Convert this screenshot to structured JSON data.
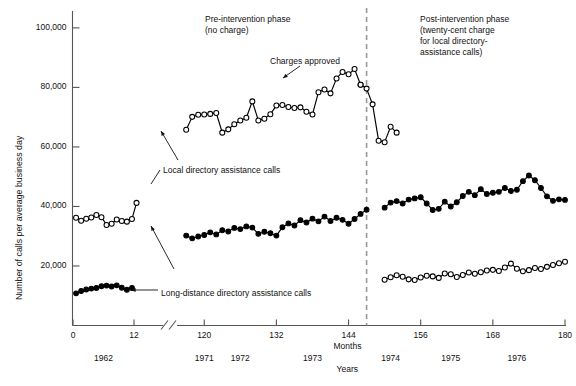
{
  "chart_data": {
    "type": "line",
    "title": "",
    "xlabel": "Months",
    "xlabel2": "Years",
    "ylabel": "Number of calls per average business day",
    "ylim": [
      0,
      105000
    ],
    "xlim": [
      0,
      180
    ],
    "grid": false,
    "legend_position": "inline-annotations",
    "y_ticks": [
      "20,000",
      "40,000",
      "60,000",
      "80,000",
      "100,000"
    ],
    "y_tick_values": [
      20000,
      40000,
      60000,
      80000,
      100000
    ],
    "x_ticks": [
      "0",
      "12",
      "120",
      "132",
      "144",
      "156",
      "168",
      "180"
    ],
    "x_tick_values": [
      0,
      12,
      120,
      132,
      144,
      156,
      168,
      180
    ],
    "axis_break_after": 12,
    "year_ticks": [
      {
        "label": "1962",
        "x": 6
      },
      {
        "label": "1971",
        "x": 120
      },
      {
        "label": "1972",
        "x": 126
      },
      {
        "label": "1973",
        "x": 138
      },
      {
        "label": "1974",
        "x": 151
      },
      {
        "label": "1975",
        "x": 161
      },
      {
        "label": "1976",
        "x": 172
      }
    ],
    "intervention_line_x": 147,
    "annotations": [
      {
        "name": "pre-intervention-label",
        "text": "Pre-intervention phase\n(no charge)",
        "x": 205,
        "y": 14
      },
      {
        "name": "post-intervention-label",
        "text": "Post-intervention phase\n(twenty-cent charge\nfor local directory-\nassistance calls)",
        "x": 420,
        "y": 14
      },
      {
        "name": "charges-approved-label",
        "text": "Charges approved",
        "x": 270,
        "y": 56
      },
      {
        "name": "local-series-label",
        "text": "Local directory assistance calls",
        "x": 163,
        "y": 165
      },
      {
        "name": "long-distance-series-label",
        "text": "Long-distance directory assistance calls",
        "x": 161,
        "y": 288
      }
    ],
    "series": [
      {
        "name": "Local directory assistance calls",
        "marker": "open-circle",
        "color": "#000000",
        "segments": [
          {
            "period": "1962",
            "x": [
              0.6,
              1.6,
              2.6,
              3.6,
              4.6,
              5.6,
              6.6,
              7.6,
              8.6,
              9.6,
              10.6,
              11.6,
              12.5
            ],
            "values": [
              36200,
              35200,
              35900,
              36300,
              37100,
              36400,
              33800,
              34200,
              35600,
              35100,
              34900,
              35800,
              41200
            ]
          },
          {
            "period": "1971-1973",
            "x": [
              117,
              118,
              119,
              120,
              121,
              122,
              123,
              124,
              125,
              126,
              127,
              128,
              129,
              130,
              131,
              132,
              133,
              134,
              135,
              136,
              137,
              138,
              139,
              140,
              141,
              142,
              143,
              144,
              145,
              146
            ],
            "values": [
              65800,
              70100,
              70800,
              70900,
              71100,
              71400,
              64800,
              65900,
              67600,
              68900,
              69800,
              75300,
              68900,
              69500,
              71000,
              73900,
              74100,
              73400,
              73100,
              73300,
              71800,
              70900,
              78400,
              79300,
              78000,
              83000,
              85200,
              84400,
              86200,
              80900
            ]
          },
          {
            "period": "1973-late",
            "x": [
              146,
              147,
              148,
              149,
              150,
              151,
              152
            ],
            "values": [
              80900,
              79600,
              74300,
              62100,
              61600,
              66800,
              64800
            ]
          }
        ]
      },
      {
        "name": "Local directory assistance calls (post)",
        "marker": "open-circle",
        "color": "#000000",
        "segments": [
          {
            "period": "1974-1976",
            "x": [
              150,
              151,
              152,
              153,
              154,
              155,
              156,
              157,
              158,
              159,
              160,
              161,
              162,
              163,
              164,
              165,
              166,
              167,
              168,
              169,
              170,
              171,
              172,
              173,
              174,
              175,
              176,
              177,
              178,
              179,
              180
            ],
            "values": [
              15400,
              16200,
              16900,
              16400,
              15500,
              15300,
              16100,
              16700,
              16500,
              16000,
              17500,
              17200,
              16300,
              17000,
              17800,
              17400,
              17900,
              18500,
              18700,
              18300,
              19500,
              20800,
              19100,
              18200,
              18600,
              19300,
              19000,
              19700,
              20300,
              20900,
              21400
            ]
          }
        ]
      },
      {
        "name": "Long-distance directory assistance calls",
        "marker": "filled-circle",
        "color": "#000000",
        "segments": [
          {
            "period": "1962",
            "x": [
              0.6,
              1.6,
              2.6,
              3.6,
              4.6,
              5.6,
              6.6,
              7.6,
              8.6,
              9.6,
              10.6,
              11.6
            ],
            "values": [
              10800,
              11600,
              12100,
              12400,
              12600,
              13200,
              13400,
              13100,
              13500,
              12700,
              12000,
              12600
            ]
          },
          {
            "period": "1971-1973",
            "x": [
              117,
              118,
              119,
              120,
              121,
              122,
              123,
              124,
              125,
              126,
              127,
              128,
              129,
              130,
              131,
              132,
              133,
              134,
              135,
              136,
              137,
              138,
              139,
              140,
              141,
              142,
              143,
              144,
              145,
              146,
              147
            ],
            "values": [
              30200,
              29300,
              29900,
              30400,
              31300,
              30600,
              32000,
              31600,
              32800,
              32400,
              33300,
              32900,
              30800,
              31500,
              31000,
              30200,
              33000,
              34300,
              33600,
              35400,
              34600,
              35900,
              35000,
              36600,
              35100,
              36200,
              35500,
              34200,
              35800,
              37500,
              38900
            ]
          }
        ]
      },
      {
        "name": "Long-distance directory assistance calls (post)",
        "marker": "filled-circle",
        "color": "#000000",
        "segments": [
          {
            "period": "1974-1976",
            "x": [
              150,
              151,
              152,
              153,
              154,
              155,
              156,
              157,
              158,
              159,
              160,
              161,
              162,
              163,
              164,
              165,
              166,
              167,
              168,
              169,
              170,
              171,
              172,
              173,
              174,
              175,
              176,
              177,
              178,
              179,
              180
            ],
            "values": [
              39600,
              41300,
              41800,
              41000,
              42300,
              42700,
              43100,
              41000,
              38800,
              39200,
              41600,
              40000,
              41400,
              43500,
              44900,
              43800,
              45800,
              44200,
              44600,
              44900,
              46200,
              45200,
              45600,
              48500,
              50400,
              48800,
              46200,
              43400,
              41900,
              42400,
              42200
            ]
          }
        ]
      }
    ]
  }
}
